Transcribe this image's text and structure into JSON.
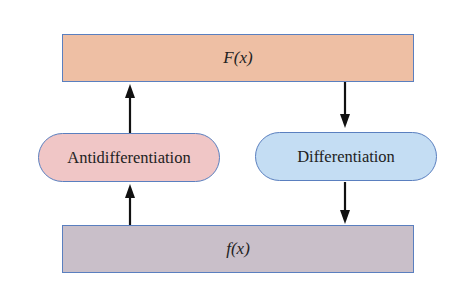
{
  "diagram": {
    "top_box": {
      "label": "F(x)",
      "color": "#eebfa4"
    },
    "bottom_box": {
      "label": "f(x)",
      "color": "#c9bfc9"
    },
    "left_process": {
      "label": "Antidifferentiation",
      "color": "#f0c6c6"
    },
    "right_process": {
      "label": "Differentiation",
      "color": "#c4ddf3"
    },
    "arrows": [
      {
        "from": "bottom_box",
        "to": "left_process",
        "direction": "up"
      },
      {
        "from": "left_process",
        "to": "top_box",
        "direction": "up"
      },
      {
        "from": "top_box",
        "to": "right_process",
        "direction": "down"
      },
      {
        "from": "right_process",
        "to": "bottom_box",
        "direction": "down"
      }
    ]
  }
}
